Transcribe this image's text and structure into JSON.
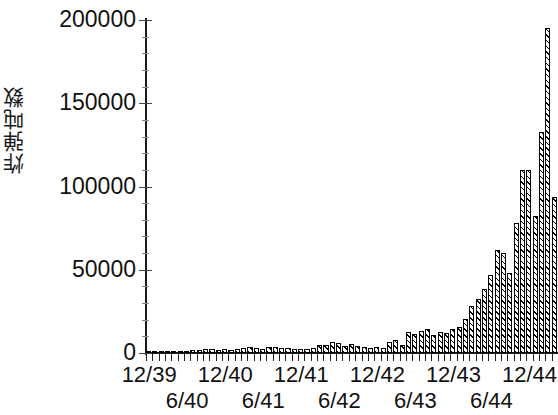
{
  "chart_data": {
    "type": "bar",
    "title": "",
    "xlabel": "",
    "ylabel": "炸弹吨数",
    "ylim": [
      0,
      200000
    ],
    "ytick_labels": [
      "0",
      "50000",
      "100000",
      "150000",
      "200000"
    ],
    "ytick_values": [
      0,
      50000,
      100000,
      150000,
      200000
    ],
    "grid": false,
    "legend": null,
    "xtick_labels_upper": [
      "12/39",
      "12/40",
      "12/41",
      "12/42",
      "12/43",
      "12/44"
    ],
    "xtick_labels_lower": [
      "6/40",
      "6/41",
      "6/42",
      "6/43",
      "6/44"
    ],
    "xtick_upper_months": [
      0,
      12,
      24,
      36,
      48,
      60
    ],
    "xtick_lower_months": [
      6,
      18,
      30,
      42,
      54
    ],
    "categories": [
      "12/39",
      "1/40",
      "2/40",
      "3/40",
      "4/40",
      "5/40",
      "6/40",
      "7/40",
      "8/40",
      "9/40",
      "10/40",
      "11/40",
      "12/40",
      "1/41",
      "2/41",
      "3/41",
      "4/41",
      "5/41",
      "6/41",
      "7/41",
      "8/41",
      "9/41",
      "10/41",
      "11/41",
      "12/41",
      "1/42",
      "2/42",
      "3/42",
      "4/42",
      "5/42",
      "6/42",
      "7/42",
      "8/42",
      "9/42",
      "10/42",
      "11/42",
      "12/42",
      "1/43",
      "2/43",
      "3/43",
      "4/43",
      "5/43",
      "6/43",
      "7/43",
      "8/43",
      "9/43",
      "10/43",
      "11/43",
      "12/43",
      "1/44",
      "2/44",
      "3/44",
      "4/44",
      "5/44",
      "6/44",
      "7/44",
      "8/44",
      "9/44",
      "10/44",
      "11/44",
      "12/44",
      "1/45",
      "2/45",
      "3/45",
      "4/45"
    ],
    "values": [
      300,
      400,
      500,
      700,
      900,
      1200,
      1500,
      1800,
      2000,
      2200,
      2400,
      2000,
      2600,
      1800,
      2400,
      3200,
      3500,
      3000,
      2600,
      3600,
      3800,
      2800,
      3000,
      2600,
      2400,
      2600,
      3000,
      5000,
      4600,
      6500,
      6200,
      4200,
      5200,
      4200,
      3600,
      3000,
      3400,
      3200,
      6800,
      7600,
      5000,
      12500,
      11500,
      13000,
      14500,
      11000,
      12500,
      12000,
      14500,
      15500,
      20500,
      28000,
      32500,
      38500,
      47000,
      62000,
      60000,
      48000,
      78000,
      110000,
      110000,
      82000,
      133000,
      195000,
      94000
    ],
    "bar_fill": "#ffffff",
    "bar_edge": "#000000",
    "bar_hatch": "diagonal"
  }
}
